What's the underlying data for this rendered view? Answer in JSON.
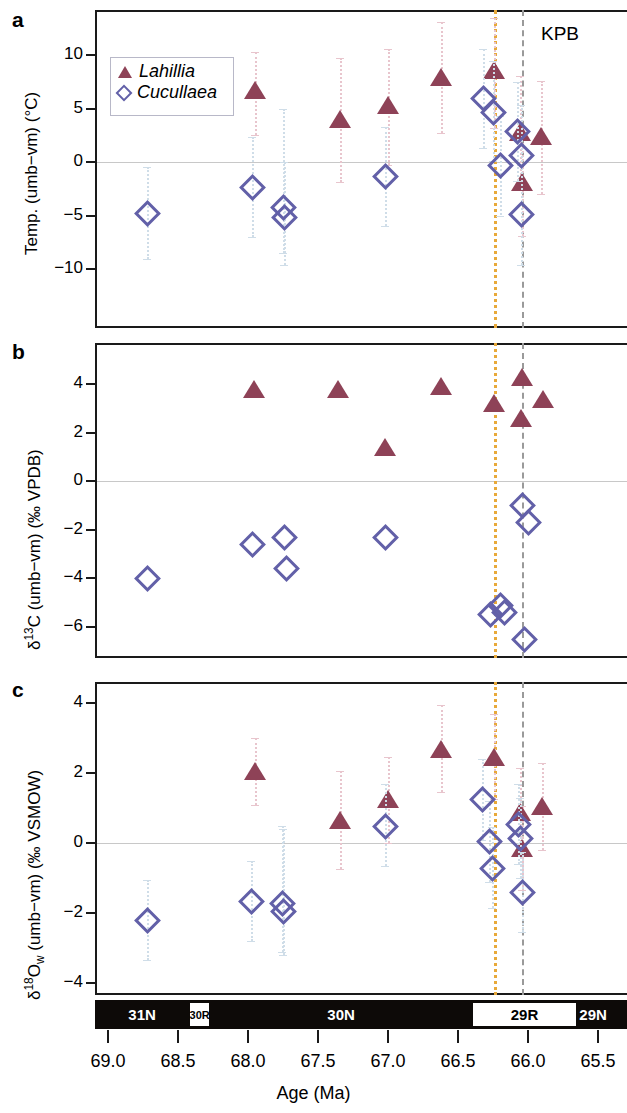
{
  "figure": {
    "panels": [
      "a",
      "b",
      "c"
    ],
    "xaxis": {
      "label": "Age (Ma)",
      "ticks": [
        69.0,
        68.5,
        68.0,
        67.5,
        67.0,
        66.5,
        66.0,
        65.5
      ],
      "tick_labels": [
        "69.0",
        "68.5",
        "68.0",
        "67.5",
        "67.0",
        "66.5",
        "66.0",
        "65.5"
      ],
      "range": [
        69.28,
        65.42
      ],
      "direction": "reversed"
    },
    "legend": {
      "items": [
        {
          "label": "Lahillia",
          "marker": "triangle",
          "color": "#8e4257"
        },
        {
          "label": "Cucullaea",
          "marker": "diamond",
          "color": "#6260a8"
        }
      ]
    },
    "annotations": {
      "kpb_label": "KPB",
      "kpb_age": 66.04,
      "orange_line_age": 66.24
    },
    "magnetostratigraphy": [
      {
        "label": "31N",
        "polarity": "normal",
        "start": 69.28,
        "end": 68.42
      },
      {
        "label": "30R",
        "polarity": "reversed",
        "start": 68.42,
        "end": 68.27
      },
      {
        "label": "30N",
        "polarity": "normal",
        "start": 68.27,
        "end": 66.4
      },
      {
        "label": "29R",
        "polarity": "reversed",
        "start": 66.4,
        "end": 65.65
      },
      {
        "label": "29N",
        "polarity": "normal",
        "start": 65.65,
        "end": 65.42
      }
    ],
    "colors": {
      "lahillia": "#8e4257",
      "cucullaea": "#6260a8",
      "lahillia_error": "#e8c5cd",
      "cucullaea_error": "#cfdde8",
      "kpb_line": "#9a9a9a",
      "orange_line": "#e8a93a",
      "zero_line": "#c8c8c8",
      "frame": "#1a1a1a"
    }
  },
  "chart_data": [
    {
      "type": "scatter",
      "panel": "a",
      "title": "",
      "xlabel": "Age (Ma)",
      "ylabel": "Temp. (umb−vm) (°C)",
      "ylim": [
        -14,
        13.5
      ],
      "yticks": [
        10,
        5,
        0,
        -5,
        -10
      ],
      "ytick_labels": [
        "10",
        "5",
        "0",
        "−5",
        "−10"
      ],
      "xlim": [
        69.28,
        65.42
      ],
      "grid": false,
      "zero_line": true,
      "series": [
        {
          "name": "Lahillia",
          "marker": "triangle",
          "color": "#8e4257",
          "points": [
            {
              "x": 67.95,
              "y": 6.7,
              "yerr_lo": 2.5,
              "yerr_hi": 10.3
            },
            {
              "x": 67.34,
              "y": 4.0,
              "yerr_lo": -1.9,
              "yerr_hi": 9.7
            },
            {
              "x": 67.0,
              "y": 5.3,
              "yerr_lo": -0.3,
              "yerr_hi": 10.6
            },
            {
              "x": 66.62,
              "y": 7.9,
              "yerr_lo": 2.7,
              "yerr_hi": 13.1
            },
            {
              "x": 66.24,
              "y": 8.6,
              "yerr_lo": 3.2,
              "yerr_hi": 13.5
            },
            {
              "x": 66.06,
              "y": 2.8,
              "yerr_lo": -2.3,
              "yerr_hi": 8.0
            },
            {
              "x": 66.04,
              "y": -1.9,
              "yerr_lo": -6.9,
              "yerr_hi": 3.2
            },
            {
              "x": 65.91,
              "y": 2.4,
              "yerr_lo": -3.0,
              "yerr_hi": 7.6
            }
          ]
        },
        {
          "name": "Cucullaea",
          "marker": "diamond",
          "color": "#6260a8",
          "points": [
            {
              "x": 68.72,
              "y": -4.8,
              "yerr_lo": -9.1,
              "yerr_hi": -0.5
            },
            {
              "x": 67.97,
              "y": -2.3,
              "yerr_lo": -7.0,
              "yerr_hi": 2.3
            },
            {
              "x": 67.75,
              "y": -4.2,
              "yerr_lo": -8.5,
              "yerr_hi": 5.0
            },
            {
              "x": 67.74,
              "y": -5.1,
              "yerr_lo": -9.6,
              "yerr_hi": 0.0
            },
            {
              "x": 67.02,
              "y": -1.3,
              "yerr_lo": -6.0,
              "yerr_hi": 3.3
            },
            {
              "x": 66.32,
              "y": 6.0,
              "yerr_lo": 1.3,
              "yerr_hi": 10.6
            },
            {
              "x": 66.25,
              "y": 4.7,
              "yerr_lo": 0.1,
              "yerr_hi": 9.4
            },
            {
              "x": 66.08,
              "y": 2.9,
              "yerr_lo": -1.8,
              "yerr_hi": 7.5
            },
            {
              "x": 66.05,
              "y": 0.7,
              "yerr_lo": -4.0,
              "yerr_hi": 5.3
            },
            {
              "x": 66.2,
              "y": -0.3,
              "yerr_lo": -5.0,
              "yerr_hi": 4.3
            },
            {
              "x": 66.05,
              "y": -4.9,
              "yerr_lo": -9.6,
              "yerr_hi": -0.3
            }
          ]
        }
      ]
    },
    {
      "type": "scatter",
      "panel": "b",
      "title": "",
      "xlabel": "Age (Ma)",
      "ylabel": "δ13C (umb−vm) (‰ VPDB)",
      "ylim": [
        -7.6,
        5.3
      ],
      "yticks": [
        4,
        2,
        0,
        -2,
        -4,
        -6
      ],
      "ytick_labels": [
        "4",
        "2",
        "0",
        "−2",
        "−4",
        "−6"
      ],
      "xlim": [
        69.28,
        65.42
      ],
      "grid": false,
      "zero_line": true,
      "series": [
        {
          "name": "Lahillia",
          "marker": "triangle",
          "color": "#8e4257",
          "points": [
            {
              "x": 67.96,
              "y": 3.8
            },
            {
              "x": 67.36,
              "y": 3.8
            },
            {
              "x": 67.02,
              "y": 1.4
            },
            {
              "x": 66.62,
              "y": 3.9
            },
            {
              "x": 66.24,
              "y": 3.2
            },
            {
              "x": 66.04,
              "y": 4.3
            },
            {
              "x": 66.05,
              "y": 2.6
            },
            {
              "x": 65.89,
              "y": 3.4
            }
          ]
        },
        {
          "name": "Cucullaea",
          "marker": "diamond",
          "color": "#6260a8",
          "points": [
            {
              "x": 68.72,
              "y": -4.0
            },
            {
              "x": 67.97,
              "y": -2.6
            },
            {
              "x": 67.74,
              "y": -2.3
            },
            {
              "x": 67.73,
              "y": -3.6
            },
            {
              "x": 67.02,
              "y": -2.3
            },
            {
              "x": 66.04,
              "y": -1.0
            },
            {
              "x": 66.0,
              "y": -1.7
            },
            {
              "x": 66.27,
              "y": -5.5
            },
            {
              "x": 66.2,
              "y": -5.1
            },
            {
              "x": 66.17,
              "y": -5.4
            },
            {
              "x": 66.03,
              "y": -6.5
            }
          ]
        }
      ]
    },
    {
      "type": "scatter",
      "panel": "c",
      "title": "",
      "xlabel": "Age (Ma)",
      "ylabel": "δ18Ow (umb−vm) (‰ VSMOW)",
      "ylim": [
        -4.8,
        4.5
      ],
      "yticks": [
        4,
        2,
        0,
        -2,
        -4
      ],
      "ytick_labels": [
        "4",
        "2",
        "0",
        "−2",
        "−4"
      ],
      "xlim": [
        69.28,
        65.42
      ],
      "grid": false,
      "zero_line": true,
      "series": [
        {
          "name": "Lahillia",
          "marker": "triangle",
          "color": "#8e4257",
          "points": [
            {
              "x": 67.95,
              "y": 2.05,
              "yerr_lo": 1.1,
              "yerr_hi": 3.0
            },
            {
              "x": 67.34,
              "y": 0.65,
              "yerr_lo": -0.75,
              "yerr_hi": 2.05
            },
            {
              "x": 67.0,
              "y": 1.25,
              "yerr_lo": 0.0,
              "yerr_hi": 2.45
            },
            {
              "x": 66.62,
              "y": 2.7,
              "yerr_lo": 1.45,
              "yerr_hi": 3.95
            },
            {
              "x": 66.24,
              "y": 2.45,
              "yerr_lo": 1.25,
              "yerr_hi": 3.7
            },
            {
              "x": 66.06,
              "y": 0.9,
              "yerr_lo": -0.3,
              "yerr_hi": 2.15
            },
            {
              "x": 66.04,
              "y": -0.15,
              "yerr_lo": -1.35,
              "yerr_hi": 1.05
            },
            {
              "x": 65.9,
              "y": 1.05,
              "yerr_lo": -0.2,
              "yerr_hi": 2.3
            }
          ]
        },
        {
          "name": "Cucullaea",
          "marker": "diamond",
          "color": "#6260a8",
          "points": [
            {
              "x": 68.72,
              "y": -2.2,
              "yerr_lo": -3.35,
              "yerr_hi": -1.05
            },
            {
              "x": 67.98,
              "y": -1.65,
              "yerr_lo": -2.8,
              "yerr_hi": -0.5
            },
            {
              "x": 67.76,
              "y": -1.7,
              "yerr_lo": -3.1,
              "yerr_hi": 0.5
            },
            {
              "x": 67.75,
              "y": -1.95,
              "yerr_lo": -3.2,
              "yerr_hi": 0.4
            },
            {
              "x": 67.02,
              "y": 0.5,
              "yerr_lo": -0.65,
              "yerr_hi": 1.7
            },
            {
              "x": 66.33,
              "y": 1.25,
              "yerr_lo": 0.1,
              "yerr_hi": 2.4
            },
            {
              "x": 66.28,
              "y": 0.05,
              "yerr_lo": -1.1,
              "yerr_hi": 1.2
            },
            {
              "x": 66.26,
              "y": -0.7,
              "yerr_lo": -1.85,
              "yerr_hi": 0.45
            },
            {
              "x": 66.07,
              "y": 0.55,
              "yerr_lo": -0.6,
              "yerr_hi": 1.7
            },
            {
              "x": 66.06,
              "y": 0.15,
              "yerr_lo": -1.0,
              "yerr_hi": 1.3
            },
            {
              "x": 66.04,
              "y": -1.4,
              "yerr_lo": -2.55,
              "yerr_hi": -0.25
            }
          ]
        }
      ]
    }
  ]
}
